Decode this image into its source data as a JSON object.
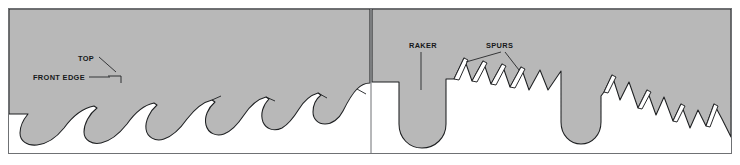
{
  "figure": {
    "name": "saw-blade-tooth-profiles",
    "width": 740,
    "height": 165,
    "background_color": "#ffffff",
    "blade_fill_color": "#b8b8b8",
    "kerf_fill_color": "#ffffff",
    "outline_color": "#1d1f21",
    "label_color": "#16181a",
    "border_color": "#6f7174"
  },
  "panels": [
    {
      "id": "left",
      "name": "hook-tooth-profile-panel",
      "description": "Circular saw blade rim with curved hook teeth and rounded gullets",
      "labels": [
        {
          "id": "top",
          "text": "TOP",
          "x": 78,
          "y": 61,
          "anchor": "start"
        },
        {
          "id": "front-edge",
          "text": "FRONT EDGE",
          "x": 33,
          "y": 80,
          "anchor": "start"
        }
      ]
    },
    {
      "id": "right",
      "name": "raker-and-spur-tooth-profile-panel",
      "description": "Blade rim with a long rounded raker tooth and angular pointed spur teeth",
      "labels": [
        {
          "id": "raker",
          "text": "RAKER",
          "x": 409,
          "y": 48,
          "anchor": "start"
        },
        {
          "id": "spurs",
          "text": "SPURS",
          "x": 486,
          "y": 48,
          "anchor": "start"
        }
      ]
    }
  ],
  "geometry": {
    "frame": {
      "x": 8,
      "y": 8,
      "w": 724,
      "h": 146
    },
    "divider_x": 371,
    "left_blade_path": "M 9 9 L 370 9 L 370 79 C 362 78 356 81 352 85 C 347 90 344 96 341 102 C 337 110 331 116 324 118 C 317 120 311 116 309 110 C 307 104 308 98 311 93 L 309 92 C 303 96 299 102 296 108 C 292 115 287 121 280 124 C 272 127 264 124 261 117 C 258 110 260 102 264 96 L 262 95 C 255 99 250 106 246 113 C 241 121 234 127 226 129 C 218 131 211 127 209 120 C 207 113 210 105 215 99 L 213 98 C 205 101 198 108 193 116 C 187 124 180 131 171 133 C 163 135 155 131 153 123 C 151 116 154 107 160 101 L 158 100 C 149 103 141 111 135 120 C 129 129 121 136 112 138 C 103 140 95 136 93 128 C 91 120 95 111 101 105 L 99 104 C 89 107 80 116 74 125 C 68 134 60 141 50 143 C 41 145 33 141 31 133 C 29 125 33 116 39 110 L 9 110 Z",
    "left_teeth_tips": [
      {
        "x": 104,
        "y": 80
      },
      {
        "x": 163,
        "y": 86
      },
      {
        "x": 218,
        "y": 92
      },
      {
        "x": 268,
        "y": 97
      },
      {
        "x": 314,
        "y": 102
      },
      {
        "x": 355,
        "y": 107
      }
    ],
    "right_blade_outline": "M 372 9 L 731 9 L 731 136 L 716 110 L 707 128 L 697 112 L 689 125 L 678 104 L 668 121 L 657 96 L 648 113 L 637 86 L 628 104 L 618 76 L 609 95 L 600 68 L 598 120 C 598 132 590 140 579 140 C 568 140 560 132 560 120 L 560 70 L 545 88 L 535 70 L 524 88 L 516 66 L 507 84 L 497 62 L 488 81 L 478 60 L 469 79 L 459 58 L 452 77 L 444 76 L 444 122 C 444 136 434 146 421 146 C 408 146 398 136 398 122 L 398 80 L 372 80 Z",
    "right_raker_tip": {
      "x": 421,
      "y": 146
    },
    "right_spur_tips": [
      {
        "x": 459,
        "y": 58
      },
      {
        "x": 478,
        "y": 60
      },
      {
        "x": 497,
        "y": 62
      },
      {
        "x": 516,
        "y": 66
      },
      {
        "x": 618,
        "y": 76
      },
      {
        "x": 657,
        "y": 96
      },
      {
        "x": 689,
        "y": 112
      },
      {
        "x": 716,
        "y": 110
      }
    ],
    "leaders": {
      "top": "M 97 57 L 112 70",
      "front_edge": "M 88 78 L 108 78",
      "raker": "M 420 52 L 420 88",
      "spurs_left": "M 500 52 L 462 66",
      "spurs_right": "M 506 52 L 520 72"
    }
  }
}
